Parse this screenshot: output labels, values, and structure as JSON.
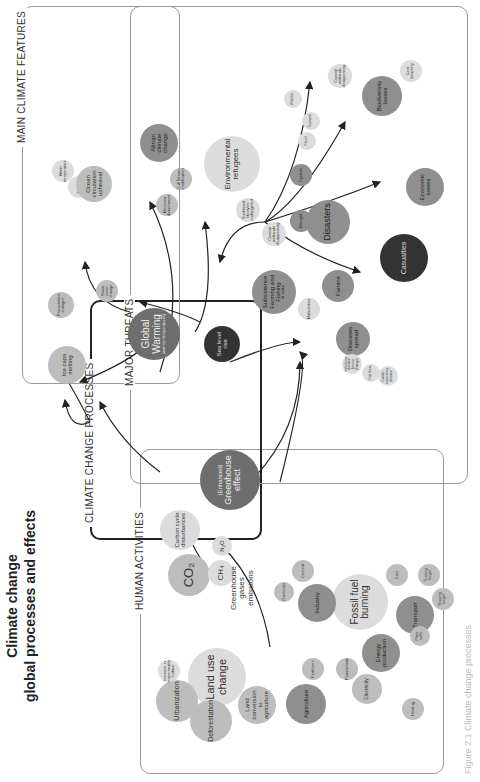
{
  "title": {
    "line1": "Climate change",
    "line2": "global processes and effects"
  },
  "caption": "Figure 2.1 Climate change processes",
  "sections": {
    "human_activities": "HUMAN ACTIVITIES",
    "climate_change_processes": "CLIMATE CHANGE PROCESSES",
    "main_climate_features": "MAIN CLIMATE FEATURES",
    "major_threats": "MAJOR THREATS"
  },
  "human_activities": {
    "land_use_change": "Land use change",
    "urbanization": "Urbanization",
    "deforestation": "Deforestation",
    "land_conversion": "Land conversion to agriculture",
    "impermeable": "Increase in impermeable surface",
    "fossil_fuel": "Fossil fuel burning",
    "industry": "Industry",
    "chemicals": "Chemicals",
    "cement": "Cement",
    "agriculture": "Agriculture",
    "fertilizers": "Fertilizers",
    "energy": "Energy production",
    "powerplants": "Powerplants",
    "electricity": "Electricity",
    "heating": "Heating",
    "transport": "Transport",
    "cars": "Cars",
    "trucking": "Trucking freight",
    "shipping": "Shipping freight",
    "plane": "Plane traffic"
  },
  "processes": {
    "carbon_cycle": "Carbon cycle disturbances",
    "co2": "CO₂",
    "ch4": "CH₄",
    "n2o": "N₂O",
    "ghg_emissions": "Greenhouse gases emissions",
    "greenhouse_prefix": "(Enhanced)",
    "greenhouse": "Greenhouse effect",
    "global_warming": "Global Warming",
    "global_warming_sub": "(warmer temperatures)",
    "sea_level": "Sea level rise"
  },
  "climate_features": {
    "ice_caps": "Ice caps melting",
    "precipitation": "Precipitation changes",
    "snow_cover": "Snow cover change",
    "water_temp": "Water temperature",
    "salinity": "Salinity",
    "ocean_circulation": "Ocean circulation upheaval",
    "abrupt": "Abrupt climate change",
    "gulf_stream": "Gulf Stream modification",
    "monsoon": "Monsoon disturbances"
  },
  "threats": {
    "environmental_refugees": "Environmental refugees",
    "traditional_lifestyles": "Traditional lifestyles endangered",
    "coastal_wetlands_1": "Coastal wetlands disappearing",
    "coastal_wetlands_2": "Coastal wetlands disappearing",
    "subsistence": "Subsistence Farming and Fishing",
    "subsistence_sub": "at stake",
    "malnutrition": "Malnutrition",
    "famine": "Famine",
    "diseases": "Diseases spread",
    "infectious": "Infectious disease (vector change)",
    "diarrhea": "Diarrhea",
    "cardio": "Cardio-respiratory disease",
    "casualties": "Casualties",
    "disasters": "Disasters",
    "drought": "Drought",
    "cyclone": "Cyclone",
    "flood": "Flood",
    "tsunami": "Tsunami",
    "wild_fire": "Wild fire",
    "economic": "Economic losses",
    "biodiversity": "Biodiversity losses",
    "coral": "Coral bleaching"
  }
}
